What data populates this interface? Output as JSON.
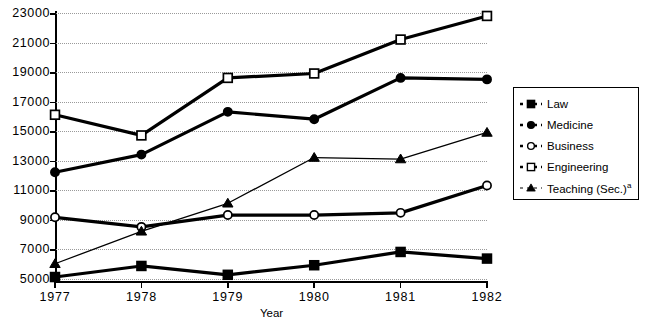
{
  "chart_data": {
    "type": "line",
    "title": "",
    "xlabel": "Year",
    "ylabel": "",
    "x": [
      1977,
      1978,
      1979,
      1980,
      1981,
      1982
    ],
    "categories": [
      "1977",
      "1978",
      "1979",
      "1980",
      "1981",
      "1982"
    ],
    "ylim": [
      4000,
      23000
    ],
    "ytick_labels": [
      "23000",
      "21000",
      "19000",
      "17000",
      "15000",
      "13000",
      "11000",
      "9000",
      "7000",
      "5000"
    ],
    "ytick_values": [
      23000,
      21000,
      19000,
      17000,
      15000,
      13000,
      11000,
      9000,
      7000,
      5000
    ],
    "grid": true,
    "legend_position": "right",
    "series": [
      {
        "name": "Law",
        "marker": "filled-square",
        "line": "thick-solid",
        "values": [
          5100,
          5850,
          5250,
          5900,
          6800,
          6350
        ]
      },
      {
        "name": "Medicine",
        "marker": "filled-circle",
        "line": "thick-solid",
        "values": [
          12200,
          13400,
          16300,
          15800,
          18600,
          18500
        ]
      },
      {
        "name": "Business",
        "marker": "open-circle",
        "line": "thick-solid",
        "values": [
          9150,
          8500,
          9300,
          9300,
          9450,
          11300
        ]
      },
      {
        "name": "Engineering",
        "marker": "open-square",
        "line": "thick-solid",
        "values": [
          16100,
          14700,
          18600,
          18900,
          21200,
          22800
        ]
      },
      {
        "name": "Teaching (Sec.)",
        "name_superscript": "a",
        "marker": "filled-triangle",
        "line": "thin-solid",
        "values": [
          6000,
          8200,
          10100,
          13200,
          13100,
          14900
        ]
      }
    ]
  },
  "legend": {
    "entries": [
      {
        "label": "Law",
        "sup": "",
        "marker": "filled-square"
      },
      {
        "label": "Medicine",
        "sup": "",
        "marker": "filled-circle"
      },
      {
        "label": "Business",
        "sup": "",
        "marker": "open-circle"
      },
      {
        "label": "Engineering",
        "sup": "",
        "marker": "open-square"
      },
      {
        "label": "Teaching (Sec.)",
        "sup": "a",
        "marker": "filled-triangle"
      }
    ]
  },
  "colors": {
    "line": "#000000",
    "grid": "#9a9a9a",
    "background": "#ffffff",
    "text": "#000000"
  }
}
